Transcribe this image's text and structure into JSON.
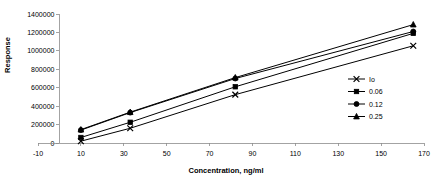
{
  "chart_data": {
    "type": "line",
    "title": "",
    "xlabel": "Concentration, ng/ml",
    "ylabel": "Response",
    "xlim": [
      -10,
      170
    ],
    "ylim": [
      0,
      1400000
    ],
    "xticks": [
      -10,
      10,
      30,
      50,
      70,
      90,
      110,
      130,
      150,
      170
    ],
    "xtick_labels": [
      "-10",
      "10",
      "30",
      "50",
      "70",
      "90",
      "110",
      "130",
      "150",
      "170"
    ],
    "yticks": [
      0,
      200000,
      400000,
      600000,
      800000,
      1000000,
      1200000,
      1400000
    ],
    "ytick_labels": [
      "0",
      "200000",
      "400000",
      "600000",
      "800000",
      "1000000",
      "1200000",
      "1400000"
    ],
    "grid": false,
    "legend_position": "right-middle",
    "x": [
      10,
      33,
      82,
      165
    ],
    "series": [
      {
        "name": "Io",
        "marker": "x-cross",
        "values": [
          20000,
          160000,
          525000,
          1055000
        ]
      },
      {
        "name": "0.06",
        "marker": "square",
        "values": [
          60000,
          225000,
          610000,
          1190000
        ]
      },
      {
        "name": "0.12",
        "marker": "circle",
        "values": [
          140000,
          330000,
          700000,
          1210000
        ]
      },
      {
        "name": "0.25",
        "marker": "triangle",
        "values": [
          145000,
          335000,
          710000,
          1285000
        ]
      }
    ]
  },
  "colors": {
    "series": "#000000",
    "axis": "#8c8c8c",
    "background": "#ffffff"
  }
}
